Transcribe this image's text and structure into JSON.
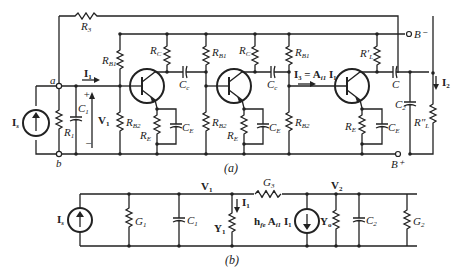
{
  "figure": {
    "subfigure_a": {
      "caption": "(a)",
      "labels": {
        "R3": "R",
        "R3_sub": "3",
        "node_a": "a",
        "node_b": "b",
        "Is": "I",
        "Is_sub": "s",
        "R1": "R",
        "R1_sub": "1",
        "C1": "C",
        "C1_sub": "1",
        "V1": "V",
        "V1_sub": "1",
        "plus": "+",
        "minus": "−",
        "I1": "I",
        "I1_sub": "1",
        "RB1": "R",
        "RB1_sub": "B1",
        "RB2": "R",
        "RB2_sub": "B2",
        "RC": "R",
        "RC_sub": "C",
        "RE": "R",
        "RE_sub": "E",
        "CE": "C",
        "CE_sub": "E",
        "Cc": "C",
        "Cc_sub": "c",
        "I3_eq": "I₃ = A",
        "I3_eq_sub": "i1",
        "I3_eq_tail": " I₁",
        "RL_prime": "R′",
        "RL_prime_sub": "L",
        "C": "C",
        "C2": "C",
        "C2_sub": "2",
        "RL_dprime": "R″",
        "RL_dprime_sub": "L",
        "I2": "I",
        "I2_sub": "2",
        "B_minus": "B⁻",
        "B_plus": "B⁺"
      }
    },
    "subfigure_b": {
      "caption": "(b)",
      "labels": {
        "Is": "I",
        "Is_sub": "s",
        "G1": "G",
        "G1_sub": "1",
        "C1": "C",
        "C1_sub": "1",
        "V1": "V",
        "V1_sub": "1",
        "Y1": "Y",
        "Y1_sub": "1",
        "I1": "I",
        "I1_sub": "1",
        "G3": "G",
        "G3_sub": "3",
        "src": "h",
        "src_sub": "fe",
        "src_mid": " A",
        "src_sub2": "i1",
        "src_tail": " I₁",
        "Yo": "Y",
        "Yo_sub": "o",
        "V2": "V",
        "V2_sub": "2",
        "C2": "C",
        "C2_sub": "2",
        "G2": "G",
        "G2_sub": "2"
      }
    }
  }
}
